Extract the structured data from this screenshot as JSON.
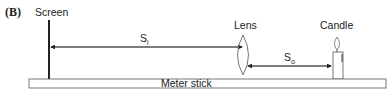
{
  "panel_label": "(B)",
  "labels": {
    "screen": "Screen",
    "lens": "Lens",
    "candle": "Candle",
    "meter_stick": "Meter stick"
  },
  "distances": {
    "image_distance": {
      "symbol": "S",
      "subscript": "i"
    },
    "object_distance": {
      "symbol": "S",
      "subscript": "o"
    }
  },
  "colors": {
    "line": "#333333",
    "lens": "#666666"
  }
}
